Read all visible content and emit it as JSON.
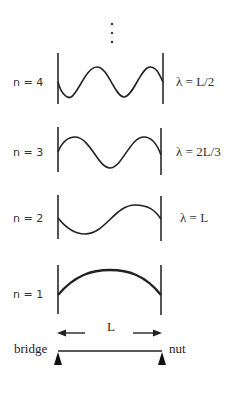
{
  "diagram": {
    "continuation": "⋮",
    "modes": [
      {
        "n_label": "n = 4",
        "lambda_label": "λ = L/2",
        "y_top": 53,
        "y_bottom": 104
      },
      {
        "n_label": "n = 3",
        "lambda_label": "λ = 2L/3",
        "y_top": 127,
        "y_bottom": 174
      },
      {
        "n_label": "n = 2",
        "lambda_label": "λ = L",
        "y_top": 195,
        "y_bottom": 240
      },
      {
        "n_label": "n = 1",
        "lambda_label": "",
        "y_top": 265,
        "y_bottom": 314
      }
    ],
    "string": {
      "length_label": "L",
      "left_end_label": "bridge",
      "right_end_label": "nut"
    },
    "colors": {
      "line": "#222222",
      "text": "#333333",
      "background": "#ffffff"
    }
  }
}
